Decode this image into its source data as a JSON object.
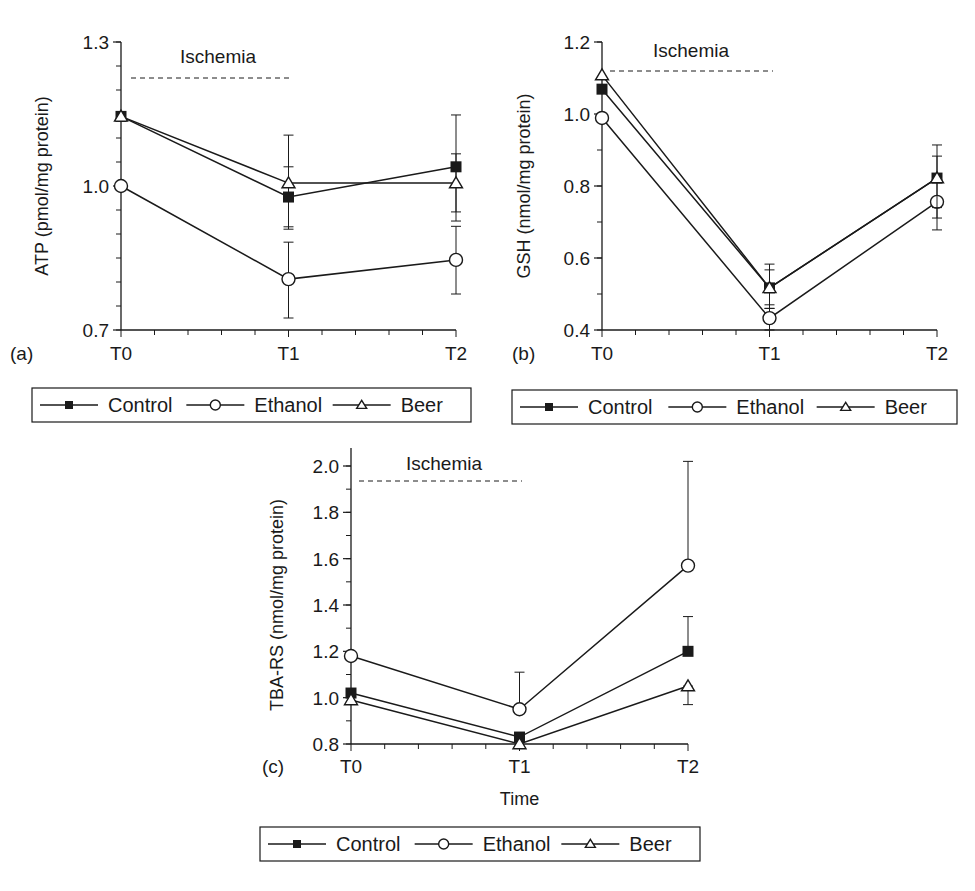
{
  "chart_data": [
    {
      "type": "line",
      "panel": "(a)",
      "title": "",
      "ylabel": "ATP (pmol/mg protein)",
      "xlabel": "",
      "categories": [
        "T0",
        "T1",
        "T2"
      ],
      "ylim": [
        0.7,
        1.3
      ],
      "yticks": [
        "1.3",
        "1.0",
        "0.7"
      ],
      "annotation": "Ischemia",
      "ischemia_span": [
        "T0",
        "T1"
      ],
      "series": [
        {
          "name": "Control",
          "marker": "filled-square",
          "values": [
            1.145,
            0.977,
            1.04
          ],
          "errors": [
            [
              1.145,
              1.145
            ],
            [
              0.915,
              1.04
            ],
            [
              0.927,
              1.148
            ]
          ]
        },
        {
          "name": "Ethanol",
          "marker": "open-circle",
          "values": [
            1.0,
            0.806,
            0.846
          ],
          "errors": [
            [
              1.0,
              1.0
            ],
            [
              0.725,
              0.883
            ],
            [
              0.775,
              0.916
            ]
          ]
        },
        {
          "name": "Beer",
          "marker": "open-triangle",
          "values": [
            1.145,
            1.006,
            1.006
          ],
          "errors": [
            [
              1.145,
              1.145
            ],
            [
              0.91,
              1.106
            ],
            [
              0.946,
              1.067
            ]
          ]
        }
      ],
      "legend_position": "below"
    },
    {
      "type": "line",
      "panel": "(b)",
      "title": "",
      "ylabel": "GSH (nmol/mg protein)",
      "xlabel": "",
      "categories": [
        "T0",
        "T1",
        "T2"
      ],
      "ylim": [
        0.4,
        1.2
      ],
      "yticks": [
        "1.2",
        "1.0",
        "0.8",
        "0.6",
        "0.4"
      ],
      "annotation": "Ischemia",
      "ischemia_span": [
        "T0",
        "T1"
      ],
      "series": [
        {
          "name": "Control",
          "marker": "filled-square",
          "values": [
            1.069,
            0.517,
            0.822
          ],
          "errors": [
            [
              1.069,
              1.069
            ],
            [
              0.46,
              0.583
            ],
            [
              0.711,
              0.914
            ]
          ]
        },
        {
          "name": "Ethanol",
          "marker": "open-circle",
          "values": [
            0.989,
            0.433,
            0.756
          ],
          "errors": [
            [
              0.989,
              0.989
            ],
            [
              0.4,
              0.46
            ],
            [
              0.678,
              0.756
            ]
          ]
        },
        {
          "name": "Beer",
          "marker": "open-triangle",
          "values": [
            1.108,
            0.517,
            0.822
          ],
          "errors": [
            [
              1.108,
              1.108
            ],
            [
              0.47,
              0.567
            ],
            [
              0.74,
              0.883
            ]
          ]
        }
      ],
      "legend_position": "below"
    },
    {
      "type": "line",
      "panel": "(c)",
      "title": "",
      "ylabel": "TBA-RS (nmol/mg protein)",
      "xlabel": "Time",
      "categories": [
        "T0",
        "T1",
        "T2"
      ],
      "ylim": [
        0.8,
        2.0
      ],
      "yticks": [
        "2.0",
        "1.8",
        "1.6",
        "1.4",
        "1.2",
        "1.0",
        "0.8"
      ],
      "annotation": "Ischemia",
      "ischemia_span": [
        "T0",
        "T1"
      ],
      "series": [
        {
          "name": "Control",
          "marker": "filled-square",
          "values": [
            1.02,
            0.83,
            1.2
          ],
          "errors": [
            [
              1.02,
              1.02
            ],
            [
              0.83,
              0.83
            ],
            [
              1.2,
              1.35
            ]
          ]
        },
        {
          "name": "Ethanol",
          "marker": "open-circle",
          "values": [
            1.18,
            0.95,
            1.57
          ],
          "errors": [
            [
              1.18,
              1.18
            ],
            [
              0.95,
              1.11
            ],
            [
              1.57,
              2.02
            ]
          ]
        },
        {
          "name": "Beer",
          "marker": "open-triangle",
          "values": [
            0.99,
            0.8,
            1.05
          ],
          "errors": [
            [
              0.99,
              0.99
            ],
            [
              0.8,
              0.8
            ],
            [
              0.97,
              1.05
            ]
          ]
        }
      ],
      "legend_position": "below"
    }
  ],
  "legend": {
    "items": [
      {
        "label": "Control",
        "marker": "filled-square"
      },
      {
        "label": "Ethanol",
        "marker": "open-circle"
      },
      {
        "label": "Beer",
        "marker": "open-triangle"
      }
    ]
  },
  "colors": {
    "ink": "#1a1a1a",
    "background": "#ffffff"
  },
  "layout": [
    {
      "x0": 121,
      "x1": 456,
      "yTop": 42,
      "yBottom": 330,
      "axisTop": 42,
      "ylabelX": 48,
      "panelLabelX": 10,
      "xLabelY": 360,
      "ischY": 78,
      "ischX0": 131,
      "ischX1": 290,
      "ischLabelX": 180,
      "ischLabelY": 63,
      "minorStep": 0.05,
      "legend": {
        "x": 32,
        "y": 388,
        "w": 439,
        "h": 34
      }
    },
    {
      "x0": 602,
      "x1": 937,
      "yTop": 42,
      "yBottom": 330,
      "axisTop": 42,
      "ylabelX": 530,
      "panelLabelX": 512,
      "xLabelY": 360,
      "ischY": 71,
      "ischX0": 610,
      "ischX1": 773,
      "ischLabelX": 653,
      "ischLabelY": 57,
      "minorStep": 0.1,
      "legend": {
        "x": 512,
        "y": 390,
        "w": 445,
        "h": 34
      }
    },
    {
      "x0": 351,
      "x1": 688,
      "yTop": 466,
      "yBottom": 744,
      "axisTop": 448,
      "ylabelX": 283,
      "panelLabelX": 262,
      "xLabelY": 773,
      "ischY": 481,
      "ischX0": 359,
      "ischX1": 522,
      "ischLabelX": 406,
      "ischLabelY": 470,
      "minorStep": 0.1,
      "xlabelY": 805,
      "legend": {
        "x": 260,
        "y": 827,
        "w": 440,
        "h": 34
      }
    }
  ]
}
